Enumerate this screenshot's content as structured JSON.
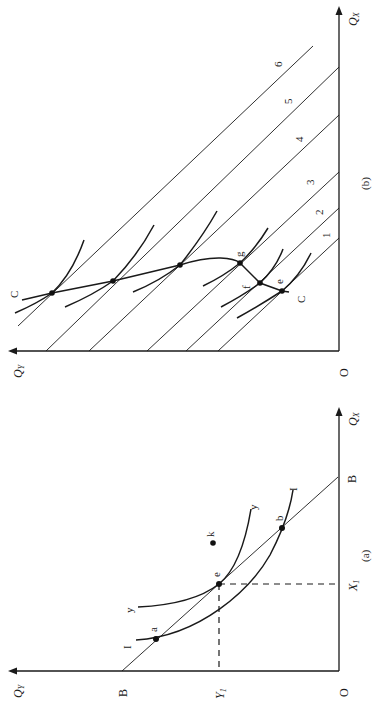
{
  "figure": {
    "orientation": "rotated 90 degrees counter-clockwise",
    "panel_a": {
      "caption": "(a)",
      "x_axis_label": "Q",
      "x_axis_sub": "X",
      "y_axis_label": "Q",
      "y_axis_sub": "Y",
      "origin_label": "O",
      "budget_label_y": "B",
      "budget_label_x": "B",
      "y1_label": "Y",
      "y1_sub": "1",
      "x1_label": "X",
      "x1_sub": "1",
      "indifference_low_label_1": "I",
      "indifference_low_label_2": "I",
      "indifference_high_label_1": "y",
      "indifference_high_label_2": "y",
      "points": {
        "a": "a",
        "e": "e",
        "b": "b",
        "k": "k"
      }
    },
    "panel_b": {
      "caption": "(b)",
      "x_axis_label": "Q",
      "x_axis_sub": "X",
      "y_axis_label": "Q",
      "y_axis_sub": "Y",
      "origin_label": "O",
      "curve_label_top": "C",
      "curve_label_bottom": "C",
      "budget_lines": [
        "1",
        "2",
        "3",
        "4",
        "5",
        "6"
      ],
      "points": {
        "e": "e",
        "f": "f",
        "g": "g"
      }
    }
  }
}
